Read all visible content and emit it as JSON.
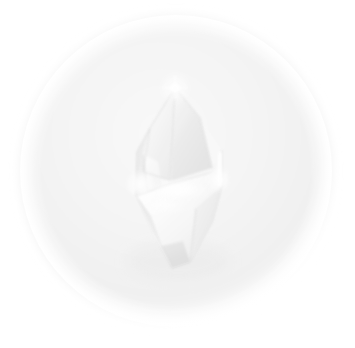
{
  "image": {
    "kind": "natural-image",
    "subject": "quartz-crystal-point",
    "alt_text": "A translucent white quartz crystal point photographed against a soft pale circular backdrop",
    "width": 355,
    "height": 348,
    "background_color": "#ffffff"
  },
  "backdrop": {
    "shape": "circle",
    "center_x": 176,
    "center_y": 171,
    "radius": 154,
    "fill_color": "#f1f1f1",
    "inner_color": "#f6f6f6",
    "edge_softness": "very-soft",
    "shadow_color": "#e9e9e9"
  },
  "crystal": {
    "name": "quartz-point",
    "body_color": "#fafafa",
    "facet_light": "#ffffff",
    "facet_mid": "#f0f0f0",
    "facet_shade": "#e2e2e2",
    "facet_deep_shade": "#d6d6d6",
    "edge_line_color": "#cfcfcf",
    "apex_x": 175,
    "apex_y": 88,
    "bottom_x": 180,
    "bottom_y": 268,
    "left_shoulder_x": 137,
    "left_shoulder_y": 152,
    "right_shoulder_x": 222,
    "right_shoulder_y": 150,
    "waist_y": 180,
    "outline_points": "175,88 150,128 137,152 136,196 152,232 172,268 190,262 212,222 222,186 222,150 200,118",
    "facets": [
      {
        "name": "apex-left-facet",
        "points": "175,88 150,128 143,170 168,178",
        "tone": "#f4f4f4"
      },
      {
        "name": "apex-right-facet",
        "points": "175,88 200,118 212,168 172,180",
        "tone": "#ededed"
      },
      {
        "name": "left-wing-facet",
        "points": "150,128 137,152 136,196 146,188 143,152",
        "tone": "#e8e8e8"
      },
      {
        "name": "left-wing-inner",
        "points": "143,152 146,188 162,196 157,160",
        "tone": "#f7f7f7"
      },
      {
        "name": "right-wing-facet",
        "points": "212,168 222,150 222,186 214,190",
        "tone": "#f2f2f2"
      },
      {
        "name": "waist-band-facet",
        "points": "136,196 168,186 212,172 222,186 196,206 150,214",
        "tone": "#ffffff"
      },
      {
        "name": "lower-left-facet",
        "points": "136,196 150,214 160,244 152,232",
        "tone": "#e6e6e6"
      },
      {
        "name": "lower-center-facet",
        "points": "150,214 196,206 190,262 172,268 160,244",
        "tone": "#f3f3f3"
      },
      {
        "name": "lower-right-facet",
        "points": "196,206 222,186 212,222 190,262",
        "tone": "#e9e9e9"
      },
      {
        "name": "bottom-tip-facet",
        "points": "160,244 172,268 190,262 182,240",
        "tone": "#dddddd"
      }
    ],
    "highlights": [
      {
        "name": "apex-specular-star",
        "x": 175,
        "y": 88,
        "radius": 13,
        "intensity": 1.0
      },
      {
        "name": "left-shoulder-specular",
        "x": 140,
        "y": 184,
        "radius": 16,
        "intensity": 0.95
      },
      {
        "name": "right-shoulder-specular",
        "x": 219,
        "y": 180,
        "radius": 14,
        "intensity": 0.9
      },
      {
        "name": "waist-specular-band",
        "x": 178,
        "y": 190,
        "radius": 30,
        "intensity": 0.85
      },
      {
        "name": "right-edge-highlight",
        "x": 220,
        "y": 165,
        "radius": 9,
        "intensity": 0.8
      }
    ]
  },
  "palette": {
    "page_white": "#ffffff",
    "backdrop_gray": "#f1f1f1",
    "crystal_white": "#fdfdfd",
    "shadow_gray": "#d6d6d6"
  }
}
